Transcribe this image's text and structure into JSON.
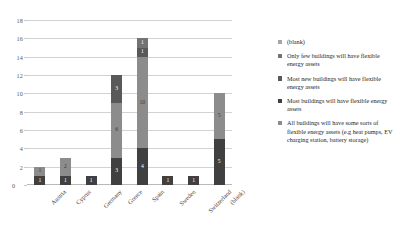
{
  "chart_data": {
    "type": "bar",
    "subtype": "stacked-column",
    "title": "",
    "xlabel": "",
    "ylabel": "",
    "ylim": [
      0,
      18
    ],
    "ytick_step": 2,
    "yticks": [
      "0",
      "2",
      "4",
      "6",
      "8",
      "10",
      "12",
      "14",
      "16",
      "18"
    ],
    "grid": true,
    "legend_position": "right",
    "categories": [
      "Austria",
      "Cyprus",
      "Germany",
      "Greece",
      "Spain",
      "Sweden",
      "Switzerland",
      "(blank)"
    ],
    "series": [
      {
        "name": "All buildings will have some sorts of flexible energy assets (e.g heat pumps, EV charging station, battery storage)",
        "color": "#404040",
        "values": [
          1,
          1,
          1,
          3,
          4,
          1,
          1,
          5
        ]
      },
      {
        "name": "Most buildings will have flexible energy assets",
        "color": "#8c8c8c",
        "values": [
          1,
          2,
          0,
          6,
          10,
          0,
          0,
          5
        ]
      },
      {
        "name": "Most new buildings will have flexible energy assets",
        "color": "#595959",
        "values": [
          0,
          0,
          0,
          3,
          1,
          0,
          0,
          0
        ]
      },
      {
        "name": "Only few buildings will have flexible energy assets",
        "color": "#737373",
        "values": [
          0,
          0,
          0,
          0,
          1,
          0,
          0,
          0
        ]
      }
    ],
    "bar_labels": {
      "Austria": [
        "1",
        "1"
      ],
      "Cyprus": [
        "1",
        "2"
      ],
      "Germany": [
        "1"
      ],
      "Greece": [
        "3",
        "6",
        "3"
      ],
      "Spain": [
        "4",
        "10",
        "1",
        "1"
      ],
      "Sweden": [
        "1"
      ],
      "Switzerland": [
        "1"
      ],
      "(blank)": [
        "5",
        "5"
      ]
    },
    "totals": [
      2,
      3,
      1,
      12,
      16,
      1,
      1,
      10
    ]
  },
  "legend": {
    "items": [
      {
        "label": "(blank)",
        "color": "#a6a6a6"
      },
      {
        "label": "Only few buildings will have flexible energy assets",
        "color": "#737373"
      },
      {
        "label": "Most new buildings will have flexible energy assets",
        "color": "#595959"
      },
      {
        "label": "Most buildings will have flexible energy assets",
        "color": "#404040"
      },
      {
        "label": "All buildings will have some sorts of flexible energy assets (e.g heat pumps, EV charging station, battery storage)",
        "color": "#8c8c8c"
      }
    ]
  },
  "axis": {
    "zero": "0"
  }
}
